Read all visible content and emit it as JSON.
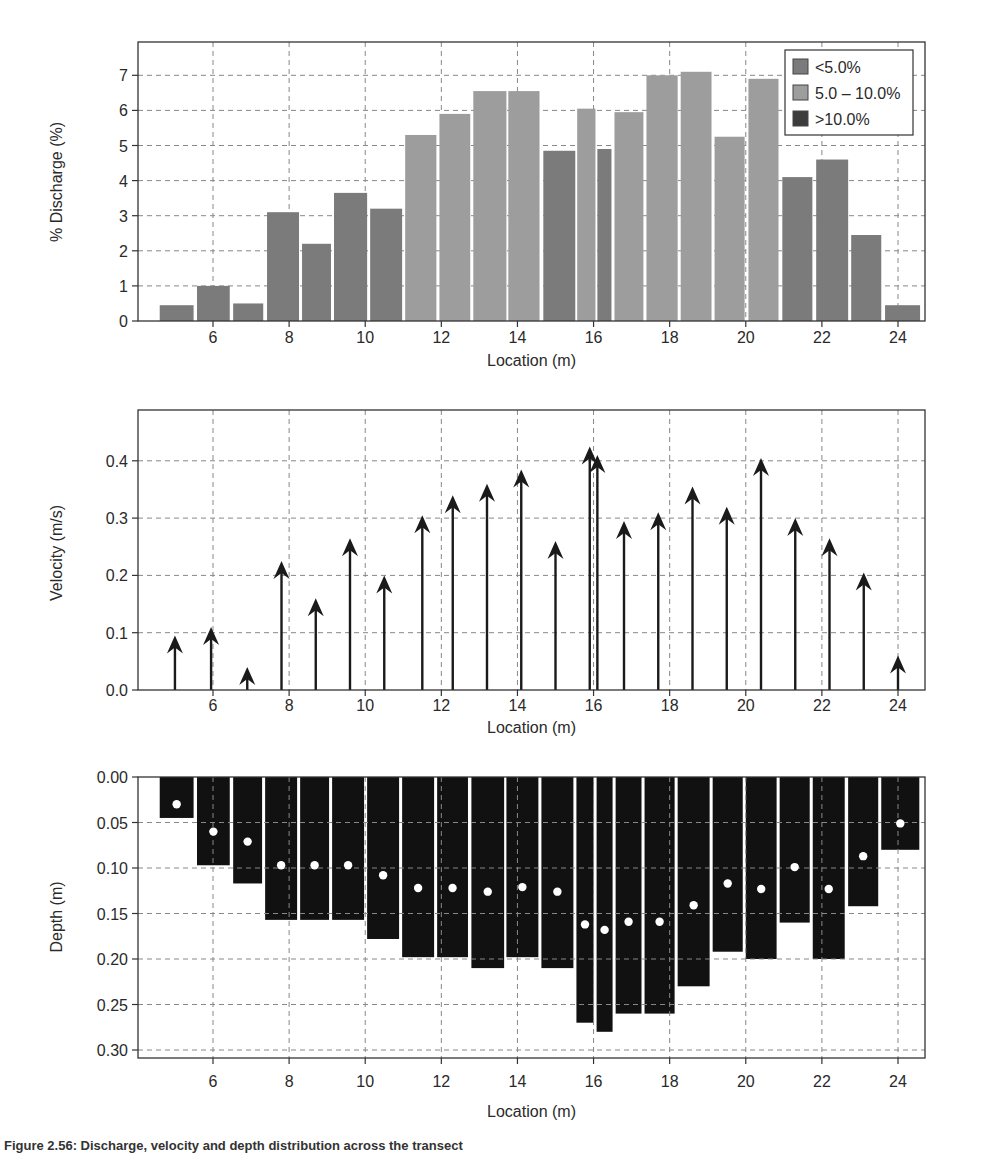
{
  "figure": {
    "caption_fragment": "Figure 2.56: Discharge, velocity and depth distribution across the transect"
  },
  "colors": {
    "lt5": "#7b7b7b",
    "mid": "#9d9d9d",
    "gt10": "#3c3c3c",
    "depth_fill": "#111111",
    "dot": "#ffffff",
    "grid": "#888888",
    "axis": "#333333"
  },
  "chart_data": [
    {
      "id": "discharge",
      "type": "bar",
      "title": "",
      "xlabel": "Location (m)",
      "ylabel": "% Discharge (%)",
      "xlim": [
        4.0,
        24.7
      ],
      "ylim": [
        0,
        7.8
      ],
      "xticks": [
        6,
        8,
        10,
        12,
        14,
        16,
        18,
        20,
        22,
        24
      ],
      "yticks": [
        0,
        1,
        2,
        3,
        4,
        5,
        6,
        7
      ],
      "grid": true,
      "legend": {
        "position": "upper right",
        "entries": [
          {
            "label": "<5.0%",
            "class": "lt5"
          },
          {
            "label": "5.0 – 10.0%",
            "class": "mid"
          },
          {
            "label": ">10.0%",
            "class": "gt10"
          }
        ]
      },
      "bars": [
        {
          "x0": 4.6,
          "x1": 5.49,
          "value": 0.45,
          "class": "lt5"
        },
        {
          "x0": 5.58,
          "x1": 6.44,
          "value": 1.0,
          "class": "lt5"
        },
        {
          "x0": 6.53,
          "x1": 7.32,
          "value": 0.5,
          "class": "lt5"
        },
        {
          "x0": 7.42,
          "x1": 8.26,
          "value": 3.1,
          "class": "lt5"
        },
        {
          "x0": 8.34,
          "x1": 9.1,
          "value": 2.2,
          "class": "lt5"
        },
        {
          "x0": 9.18,
          "x1": 10.05,
          "value": 3.65,
          "class": "lt5"
        },
        {
          "x0": 10.13,
          "x1": 10.97,
          "value": 3.2,
          "class": "lt5"
        },
        {
          "x0": 11.05,
          "x1": 11.87,
          "value": 5.3,
          "class": "mid"
        },
        {
          "x0": 11.95,
          "x1": 12.76,
          "value": 5.9,
          "class": "mid"
        },
        {
          "x0": 12.84,
          "x1": 13.71,
          "value": 6.55,
          "class": "mid"
        },
        {
          "x0": 13.76,
          "x1": 14.58,
          "value": 6.55,
          "class": "mid"
        },
        {
          "x0": 14.68,
          "x1": 15.52,
          "value": 4.85,
          "class": "lt5"
        },
        {
          "x0": 15.57,
          "x1": 16.05,
          "value": 6.05,
          "class": "mid"
        },
        {
          "x0": 16.1,
          "x1": 16.47,
          "value": 4.9,
          "class": "lt5"
        },
        {
          "x0": 16.55,
          "x1": 17.31,
          "value": 5.95,
          "class": "mid"
        },
        {
          "x0": 17.39,
          "x1": 18.21,
          "value": 7.0,
          "class": "mid"
        },
        {
          "x0": 18.29,
          "x1": 19.1,
          "value": 7.1,
          "class": "mid"
        },
        {
          "x0": 19.18,
          "x1": 19.97,
          "value": 5.25,
          "class": "mid"
        },
        {
          "x0": 20.07,
          "x1": 20.86,
          "value": 6.9,
          "class": "mid"
        },
        {
          "x0": 20.96,
          "x1": 21.75,
          "value": 4.1,
          "class": "lt5"
        },
        {
          "x0": 21.85,
          "x1": 22.69,
          "value": 4.6,
          "class": "lt5"
        },
        {
          "x0": 22.77,
          "x1": 23.56,
          "value": 2.45,
          "class": "lt5"
        },
        {
          "x0": 23.66,
          "x1": 24.58,
          "value": 0.45,
          "class": "lt5"
        }
      ]
    },
    {
      "id": "velocity",
      "type": "quiver",
      "title": "",
      "xlabel": "Location (m)",
      "ylabel": "Velocity (m/s)",
      "xlim": [
        4.0,
        24.7
      ],
      "ylim": [
        0,
        0.48
      ],
      "xticks": [
        6,
        8,
        10,
        12,
        14,
        16,
        18,
        20,
        22,
        24
      ],
      "yticks": [
        "0.0",
        "0.1",
        "0.2",
        "0.3",
        "0.4"
      ],
      "grid": true,
      "x": [
        5.0,
        5.95,
        6.9,
        7.8,
        8.7,
        9.6,
        10.5,
        11.5,
        12.3,
        13.2,
        14.1,
        15.0,
        15.9,
        16.1,
        16.8,
        17.7,
        18.6,
        19.5,
        20.4,
        21.3,
        22.2,
        23.1,
        24.0
      ],
      "values": [
        0.095,
        0.11,
        0.04,
        0.225,
        0.16,
        0.265,
        0.2,
        0.305,
        0.34,
        0.36,
        0.385,
        0.26,
        0.425,
        0.41,
        0.295,
        0.31,
        0.355,
        0.32,
        0.405,
        0.3,
        0.265,
        0.205,
        0.06
      ]
    },
    {
      "id": "depth",
      "type": "bar",
      "title": "",
      "xlabel": "Location (m)",
      "ylabel": "Depth (m)",
      "xlim": [
        4.0,
        24.7
      ],
      "ylim": [
        0.31,
        0.0
      ],
      "inverted_y": true,
      "xticks": [
        6,
        8,
        10,
        12,
        14,
        16,
        18,
        20,
        22,
        24
      ],
      "yticks": [
        "0.00",
        "0.05",
        "0.10",
        "0.15",
        "0.20",
        "0.25",
        "0.30"
      ],
      "grid": true,
      "columns": [
        {
          "x0": 4.6,
          "x1": 5.49,
          "depth": 0.045,
          "point": 0.03
        },
        {
          "x0": 5.58,
          "x1": 6.44,
          "depth": 0.097,
          "point": 0.06
        },
        {
          "x0": 6.53,
          "x1": 7.29,
          "depth": 0.117,
          "point": 0.071
        },
        {
          "x0": 7.37,
          "x1": 8.21,
          "depth": 0.157,
          "point": 0.097
        },
        {
          "x0": 8.29,
          "x1": 9.05,
          "depth": 0.157,
          "point": 0.097
        },
        {
          "x0": 9.13,
          "x1": 9.97,
          "depth": 0.157,
          "point": 0.097
        },
        {
          "x0": 10.05,
          "x1": 10.89,
          "depth": 0.178,
          "point": 0.108
        },
        {
          "x0": 10.97,
          "x1": 11.81,
          "depth": 0.198,
          "point": 0.122
        },
        {
          "x0": 11.89,
          "x1": 12.7,
          "depth": 0.198,
          "point": 0.122
        },
        {
          "x0": 12.79,
          "x1": 13.65,
          "depth": 0.21,
          "point": 0.126
        },
        {
          "x0": 13.71,
          "x1": 14.55,
          "depth": 0.198,
          "point": 0.121
        },
        {
          "x0": 14.63,
          "x1": 15.47,
          "depth": 0.21,
          "point": 0.126
        },
        {
          "x0": 15.55,
          "x1": 16.0,
          "depth": 0.27,
          "point": 0.162
        },
        {
          "x0": 16.08,
          "x1": 16.5,
          "depth": 0.28,
          "point": 0.168
        },
        {
          "x0": 16.58,
          "x1": 17.26,
          "depth": 0.26,
          "point": 0.159
        },
        {
          "x0": 17.34,
          "x1": 18.13,
          "depth": 0.26,
          "point": 0.159
        },
        {
          "x0": 18.21,
          "x1": 19.05,
          "depth": 0.23,
          "point": 0.141
        },
        {
          "x0": 19.13,
          "x1": 19.92,
          "depth": 0.192,
          "point": 0.117
        },
        {
          "x0": 20.0,
          "x1": 20.81,
          "depth": 0.2,
          "point": 0.123
        },
        {
          "x0": 20.89,
          "x1": 21.68,
          "depth": 0.16,
          "point": 0.099
        },
        {
          "x0": 21.76,
          "x1": 22.6,
          "depth": 0.2,
          "point": 0.123
        },
        {
          "x0": 22.69,
          "x1": 23.48,
          "depth": 0.142,
          "point": 0.087
        },
        {
          "x0": 23.56,
          "x1": 24.56,
          "depth": 0.08,
          "point": 0.051
        }
      ]
    }
  ]
}
